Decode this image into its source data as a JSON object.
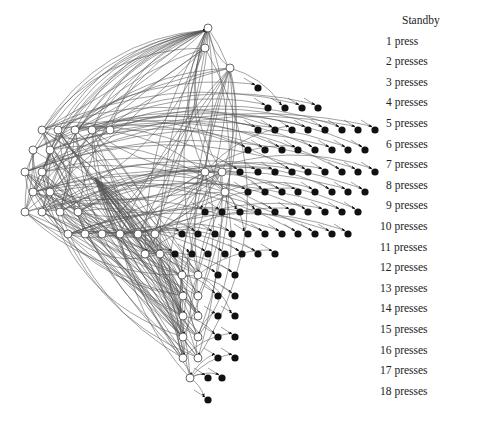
{
  "figure": {
    "type": "directed-state-graph"
  },
  "legend": {
    "title": "Standby",
    "items": [
      {
        "label": "1 press"
      },
      {
        "label": "2 presses"
      },
      {
        "label": "3 presses"
      },
      {
        "label": "4 presses"
      },
      {
        "label": "5 presses"
      },
      {
        "label": "6 presses"
      },
      {
        "label": "7 presses"
      },
      {
        "label": "8 presses"
      },
      {
        "label": "9 presses"
      },
      {
        "label": "10 presses"
      },
      {
        "label": "11 presses"
      },
      {
        "label": "12 presses"
      },
      {
        "label": "13 presses"
      },
      {
        "label": "14 presses"
      },
      {
        "label": "15 presses"
      },
      {
        "label": "16 presses"
      },
      {
        "label": "17 presses"
      },
      {
        "label": "18 presses"
      }
    ]
  },
  "colors": {
    "edge": "#555555",
    "node_open_fill": "#ffffff",
    "node_filled": "#111111",
    "text": "#222222"
  },
  "rows": [
    {
      "y": 28,
      "open_x": [
        208
      ],
      "filled_x": []
    },
    {
      "y": 48,
      "open_x": [
        205
      ],
      "filled_x": []
    },
    {
      "y": 68,
      "open_x": [
        230
      ],
      "filled_x": []
    },
    {
      "y": 88,
      "open_x": [],
      "filled_x": [
        258
      ]
    },
    {
      "y": 108,
      "open_x": [],
      "filled_x": [
        268,
        285,
        302,
        318
      ]
    },
    {
      "y": 130,
      "open_x": [
        42,
        58,
        75,
        92,
        110
      ],
      "filled_x": [
        258,
        275,
        292,
        308,
        325,
        342,
        358,
        375
      ]
    },
    {
      "y": 150,
      "open_x": [
        33,
        50
      ],
      "filled_x": [
        248,
        265,
        282,
        298,
        315,
        332,
        348,
        365
      ]
    },
    {
      "y": 172,
      "open_x": [
        25,
        42,
        205,
        222
      ],
      "filled_x": [
        240,
        258,
        275,
        292,
        308,
        325,
        342,
        358,
        375
      ]
    },
    {
      "y": 192,
      "open_x": [
        33,
        50,
        225
      ],
      "filled_x": [
        248,
        265,
        282,
        298,
        315,
        332,
        348,
        365
      ]
    },
    {
      "y": 212,
      "open_x": [
        25,
        42,
        60,
        78
      ],
      "filled_x": [
        205,
        222,
        240,
        258,
        275,
        292,
        308,
        325,
        342,
        358
      ]
    },
    {
      "y": 234,
      "open_x": [
        68,
        85,
        102,
        120,
        138,
        155
      ],
      "filled_x": [
        182,
        198,
        215,
        232,
        248,
        265,
        282,
        298,
        315,
        332,
        348
      ]
    },
    {
      "y": 254,
      "open_x": [
        145,
        160
      ],
      "filled_x": [
        175,
        192,
        208,
        225,
        242,
        258,
        275
      ]
    },
    {
      "y": 275,
      "open_x": [
        182,
        198
      ],
      "filled_x": [
        218,
        235
      ]
    },
    {
      "y": 296,
      "open_x": [
        183,
        198
      ],
      "filled_x": [
        218,
        235
      ]
    },
    {
      "y": 316,
      "open_x": [
        183,
        198
      ],
      "filled_x": [
        218,
        235
      ]
    },
    {
      "y": 337,
      "open_x": [
        183,
        198
      ],
      "filled_x": [
        218,
        235
      ]
    },
    {
      "y": 358,
      "open_x": [
        183,
        198
      ],
      "filled_x": [
        218,
        235
      ]
    },
    {
      "y": 378,
      "open_x": [
        190
      ],
      "filled_x": [
        208,
        222
      ]
    },
    {
      "y": 400,
      "open_x": [],
      "filled_x": [
        208
      ]
    }
  ]
}
